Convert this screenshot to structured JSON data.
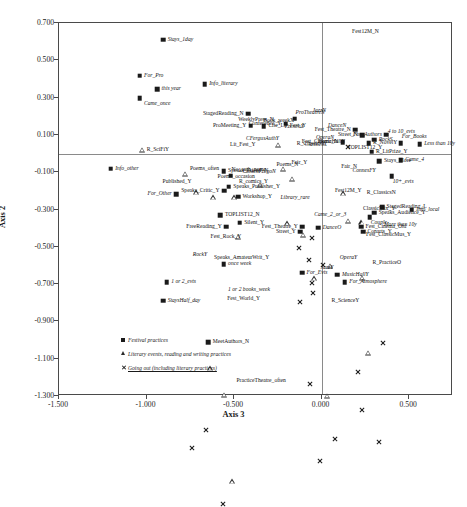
{
  "chart_data": {
    "type": "scatter",
    "title": "",
    "xlabel": "Axis 3",
    "ylabel": "Axis 2",
    "xlim": [
      -1.5,
      0.75
    ],
    "ylim": [
      -1.3,
      0.7
    ],
    "xticks": [
      "-1.500",
      "-1.000",
      "-0.500",
      "0.000",
      "0.500"
    ],
    "xtick_values": [
      -1.5,
      -1.0,
      -0.5,
      0.0,
      0.5
    ],
    "yticks": [
      "0.700",
      "0.500",
      "0.300",
      "0.100",
      "-0.100",
      "-0.300",
      "-0.500",
      "-0.700",
      "-0.900",
      "-1.100",
      "-1.300"
    ],
    "ytick_values": [
      0.7,
      0.5,
      0.3,
      0.1,
      -0.1,
      -0.3,
      -0.5,
      -0.7,
      -0.9,
      -1.1,
      -1.3
    ],
    "grid": false,
    "legend_position": "bottom-left-inside",
    "series": [
      {
        "name": "Festival practices",
        "marker": "square",
        "points": [
          {
            "label": "Stays_1day",
            "x": -0.905,
            "y": 0.61,
            "pos": "right"
          },
          {
            "label": "For_Pro",
            "x": -1.04,
            "y": 0.418,
            "pos": "right"
          },
          {
            "label": "this year",
            "x": -0.94,
            "y": 0.345,
            "pos": "right"
          },
          {
            "label": "Came_once",
            "x": -1.04,
            "y": 0.297,
            "pos": "right-below"
          },
          {
            "label": "Info_literary",
            "x": -0.668,
            "y": 0.372,
            "pos": "right"
          },
          {
            "label": "StagedReading_N",
            "x": -0.42,
            "y": 0.213,
            "pos": "left"
          },
          {
            "label": "ProMeeting_Y",
            "x": -0.405,
            "y": 0.15,
            "pos": "left"
          },
          {
            "label": "Cite_Lit_Fest_Y",
            "x": -0.33,
            "y": 0.148,
            "pos": "right"
          },
          {
            "label": "Conference_Y",
            "x": -0.205,
            "y": 0.16,
            "pos": "left"
          },
          {
            "label": "ProTheatreN",
            "x": -0.155,
            "y": 0.186,
            "pos": "above"
          },
          {
            "label": "Fest_Theatre_N",
            "x": 0.192,
            "y": 0.128,
            "pos": "left"
          },
          {
            "label": "Street_N",
            "x": 0.232,
            "y": 0.098,
            "pos": "left"
          },
          {
            "label": "Fest_Cinema_N",
            "x": 0.12,
            "y": 0.062,
            "pos": "left"
          },
          {
            "label": "For_Authors",
            "x": 0.37,
            "y": 0.1,
            "pos": "left"
          },
          {
            "label": "For_Books",
            "x": 0.452,
            "y": 0.055,
            "pos": "above"
          },
          {
            "label": "Less than 10y",
            "x": 0.56,
            "y": 0.05,
            "pos": "right"
          },
          {
            "label": "Info_other",
            "x": -1.205,
            "y": -0.082,
            "pos": "right"
          },
          {
            "label": "Stays_More",
            "x": 0.33,
            "y": -0.04,
            "pos": "right"
          },
          {
            "label": "Came_4",
            "x": 0.452,
            "y": -0.035,
            "pos": "right"
          },
          {
            "label": "10+_evts",
            "x": 0.4,
            "y": -0.12,
            "pos": "below"
          },
          {
            "label": "No_auth_name",
            "x": -0.52,
            "y": -0.118,
            "pos": "above"
          },
          {
            "label": "Speaks_Friend_N",
            "x": -0.56,
            "y": -0.095,
            "pos": "right"
          },
          {
            "label": "Speaks_Publisher_Y",
            "x": -0.53,
            "y": -0.178,
            "pos": "right"
          },
          {
            "label": "Speaks_Critic_Y",
            "x": -0.558,
            "y": -0.2,
            "pos": "left"
          },
          {
            "label": "For_Other",
            "x": -0.83,
            "y": -0.218,
            "pos": "left"
          },
          {
            "label": "Workshop_Y",
            "x": -0.478,
            "y": -0.232,
            "pos": "right"
          },
          {
            "label": "StagedReading_L",
            "x": 0.345,
            "y": -0.288,
            "pos": "right"
          },
          {
            "label": "Speaks_Audience_Y",
            "x": 0.3,
            "y": -0.318,
            "pos": "right"
          },
          {
            "label": "Couple",
            "x": 0.275,
            "y": -0.34,
            "pos": "below"
          },
          {
            "label": "Info_local",
            "x": 0.515,
            "y": -0.3,
            "pos": "right"
          },
          {
            "label": "TOPLIST12_N",
            "x": -0.578,
            "y": -0.332,
            "pos": "right"
          },
          {
            "label": "FreeReading_Y",
            "x": -0.545,
            "y": -0.392,
            "pos": "left"
          },
          {
            "label": "Silent_Y",
            "x": -0.468,
            "y": -0.37,
            "pos": "right"
          },
          {
            "label": "Fest_Theatre_Y",
            "x": -0.11,
            "y": -0.392,
            "pos": "left"
          },
          {
            "label": "Street_Y",
            "x": -0.122,
            "y": -0.42,
            "pos": "left"
          },
          {
            "label": "DanceO",
            "x": -0.02,
            "y": -0.398,
            "pos": "right"
          },
          {
            "label": "Fest_Cinema_Old",
            "x": 0.225,
            "y": -0.392,
            "pos": "right"
          },
          {
            "label": "Conarts_Y",
            "x": 0.236,
            "y": -0.42,
            "pos": "right"
          },
          {
            "label": "MusicHallY",
            "x": 0.09,
            "y": -0.65,
            "pos": "right"
          },
          {
            "label": "For_Evts",
            "x": -0.112,
            "y": -0.638,
            "pos": "right"
          },
          {
            "label": "For_Atmosphere",
            "x": 0.132,
            "y": -0.69,
            "pos": "right"
          },
          {
            "label": "once week",
            "x": -0.56,
            "y": -0.592,
            "pos": "right"
          },
          {
            "label": "1 or 2_evts",
            "x": -0.885,
            "y": -0.69,
            "pos": "right"
          },
          {
            "label": "StaysHalf_day",
            "x": -0.905,
            "y": -0.79,
            "pos": "right"
          },
          {
            "label": "MeetAuthors_N",
            "x": -0.648,
            "y": -1.01,
            "pos": "right"
          },
          {
            "label": "R_LitPrize_Y",
            "x": 0.285,
            "y": 0.01,
            "pos": "right"
          },
          {
            "label": "R_NovelY",
            "x": 0.268,
            "y": 0.055,
            "pos": "right"
          },
          {
            "label": "RockS",
            "x": 0.3,
            "y": 0.075,
            "pos": "right"
          }
        ]
      },
      {
        "name": "Literary events, reading and writing practices",
        "marker": "triangle",
        "points": [
          {
            "label": "R_SciFiY",
            "x": -1.025,
            "y": 0.02,
            "pos": "right"
          },
          {
            "label": "Poems_often",
            "x": -0.778,
            "y": -0.082,
            "pos": "right"
          },
          {
            "label": "Published_Y",
            "x": -0.718,
            "y": -0.155,
            "pos": "left"
          },
          {
            "label": "R_comics_Y",
            "x": -0.498,
            "y": -0.155,
            "pos": "right"
          },
          {
            "label": "Poems_occasion",
            "x": -0.62,
            "y": -0.128,
            "pos": "right"
          },
          {
            "label": "WeeklyPress_N",
            "x": -0.248,
            "y": 0.182,
            "pos": "left"
          },
          {
            "label": "CFergusAuthY",
            "x": -0.218,
            "y": 0.08,
            "pos": "left"
          },
          {
            "label": "R_ClassicsY",
            "x": -0.168,
            "y": 0.052,
            "pos": "right"
          },
          {
            "label": "Lit_Fest_Y",
            "x": -0.352,
            "y": 0.048,
            "pos": "left"
          },
          {
            "label": "TOPLIST12_Y",
            "x": 0.122,
            "y": 0.028,
            "pos": "right"
          },
          {
            "label": "ConnesFY",
            "x": 0.15,
            "y": -0.092,
            "pos": "right"
          },
          {
            "label": "Fair_N",
            "x": 0.228,
            "y": -0.072,
            "pos": "left"
          },
          {
            "label": "Fair_Y",
            "x": -0.198,
            "y": -0.052,
            "pos": "right"
          },
          {
            "label": "ContenFregoN",
            "x": -0.478,
            "y": -0.098,
            "pos": "right"
          },
          {
            "label": "Poems_N",
            "x": -0.108,
            "y": -0.06,
            "pos": "left"
          },
          {
            "label": "Fest12M_Y",
            "x": 0.05,
            "y": -0.2,
            "pos": "right"
          },
          {
            "label": "Library_rare",
            "x": -0.042,
            "y": -0.238,
            "pos": "left"
          },
          {
            "label": "R_ClassicsN",
            "x": 0.232,
            "y": -0.21,
            "pos": "right"
          },
          {
            "label": "R_PracticeO",
            "x": 0.265,
            "y": -0.585,
            "pos": "right"
          },
          {
            "label": "R_ScienceY",
            "x": 0.03,
            "y": -0.79,
            "pos": "right"
          },
          {
            "label": "PracticeTheatre_often",
            "x": -0.512,
            "y": -1.222,
            "pos": "right"
          },
          {
            "label": "1 or 2 books_week",
            "x": -0.56,
            "y": -0.73,
            "pos": "right"
          },
          {
            "label": "Speaks_AmateurWrit_Y",
            "x": -0.64,
            "y": -0.562,
            "pos": "right"
          }
        ]
      },
      {
        "name": "Going out (including literary practices)",
        "marker": "cross",
        "points": [
          {
            "label": "Fest12M_N",
            "x": 0.148,
            "y": 0.65,
            "pos": "right"
          },
          {
            "label": "JazzN",
            "x": -0.058,
            "y": 0.195,
            "pos": "above"
          },
          {
            "label": "Book_weekX",
            "x": -0.132,
            "y": 0.172,
            "pos": "left"
          },
          {
            "label": "FrenchX",
            "x": -0.075,
            "y": 0.14,
            "pos": "left"
          },
          {
            "label": "DanceN",
            "x": 0.01,
            "y": 0.148,
            "pos": "right"
          },
          {
            "label": "OperaN",
            "x": -0.058,
            "y": 0.082,
            "pos": "right"
          },
          {
            "label": "MusicHallN",
            "x": -0.048,
            "y": 0.062,
            "pos": "right"
          },
          {
            "label": "ClassicsX",
            "x": -0.122,
            "y": 0.048,
            "pos": "right"
          },
          {
            "label": "ClassicMix_Y",
            "x": 0.21,
            "y": -0.298,
            "pos": "right"
          },
          {
            "label": "Came_2_or_3",
            "x": -0.068,
            "y": -0.33,
            "pos": "right"
          },
          {
            "label": "Fest_ClassicMus_Y",
            "x": 0.228,
            "y": -0.435,
            "pos": "right"
          },
          {
            "label": "OperaY",
            "x": 0.078,
            "y": -0.56,
            "pos": "right"
          },
          {
            "label": "JazzY",
            "x": -0.012,
            "y": -0.648,
            "pos": "above"
          },
          {
            "label": "Fest_Rock_Y",
            "x": -0.66,
            "y": -0.45,
            "pos": "right"
          },
          {
            "label": "RockY",
            "x": -0.742,
            "y": -0.51,
            "pos": "below"
          },
          {
            "label": "Fest_World_Y",
            "x": -0.565,
            "y": -0.782,
            "pos": "right"
          },
          {
            "label": "4 to 10_evts",
            "x": 0.352,
            "y": 0.118,
            "pos": "right"
          },
          {
            "label": "More than 10y",
            "x": 0.33,
            "y": -0.382,
            "pos": "right"
          }
        ]
      }
    ],
    "legend": [
      {
        "marker": "square",
        "label": "Festival practices"
      },
      {
        "marker": "triangle",
        "label": "Literary events, reading and writing practices"
      },
      {
        "marker": "cross",
        "label": "Going out (including literary practices)"
      }
    ]
  },
  "caption": {
    "text": ""
  }
}
